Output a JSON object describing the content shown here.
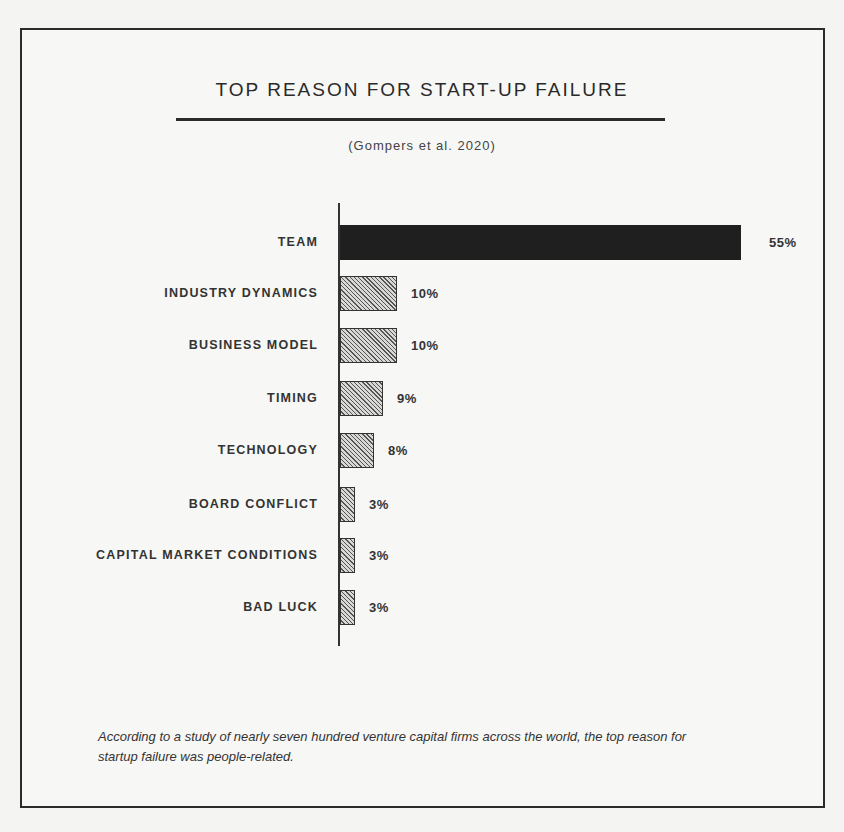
{
  "header": {
    "title": "TOP REASON FOR START-UP FAILURE",
    "subtitle": "(Gompers et al. 2020)"
  },
  "caption": "According to a study of nearly seven hundred venture capital firms across the world, the top reason for startup failure was people-related.",
  "colors": {
    "highlight_bar": "#1f1f1f",
    "hatched_bar_fill": "#d8d8d6",
    "hatched_bar_line": "#555555",
    "frame": "#2b2b2b"
  },
  "chart_data": {
    "type": "bar",
    "orientation": "horizontal",
    "title": "TOP REASON FOR START-UP FAILURE",
    "subtitle": "(Gompers et al. 2020)",
    "xlabel": "",
    "ylabel": "",
    "categories": [
      "TEAM",
      "INDUSTRY DYNAMICS",
      "BUSINESS MODEL",
      "TIMING",
      "TECHNOLOGY",
      "BOARD CONFLICT",
      "CAPITAL MARKET CONDITIONS",
      "BAD LUCK"
    ],
    "values": [
      55,
      10,
      10,
      9,
      8,
      3,
      3,
      3
    ],
    "value_labels": [
      "55%",
      "10%",
      "10%",
      "9%",
      "8%",
      "3%",
      "3%",
      "3%"
    ],
    "unit": "%",
    "grid": false,
    "legend": null,
    "annotations": [
      "According to a study of nearly seven hundred venture capital firms across the world, the top reason for startup failure was people-related."
    ]
  },
  "bars": [
    {
      "label": "TEAM",
      "value": "55%",
      "width": 401,
      "top": 225,
      "style": "solid"
    },
    {
      "label": "INDUSTRY DYNAMICS",
      "value": "10%",
      "width": 57,
      "top": 276,
      "style": "hatched"
    },
    {
      "label": "BUSINESS MODEL",
      "value": "10%",
      "width": 57,
      "top": 328,
      "style": "hatched"
    },
    {
      "label": "TIMING",
      "value": "9%",
      "width": 43,
      "top": 381,
      "style": "hatched"
    },
    {
      "label": "TECHNOLOGY",
      "value": "8%",
      "width": 34,
      "top": 433,
      "style": "hatched"
    },
    {
      "label": "BOARD CONFLICT",
      "value": "3%",
      "width": 15,
      "top": 487,
      "style": "hatched"
    },
    {
      "label": "CAPITAL MARKET CONDITIONS",
      "value": "3%",
      "width": 15,
      "top": 538,
      "style": "hatched"
    },
    {
      "label": "BAD LUCK",
      "value": "3%",
      "width": 15,
      "top": 590,
      "style": "hatched"
    }
  ]
}
